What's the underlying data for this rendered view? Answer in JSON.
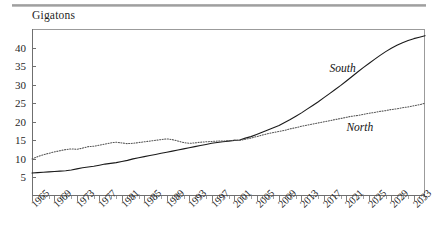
{
  "figure": {
    "top_rule": "horizontal-rule",
    "axis_caption": "Gigatons"
  },
  "chart_data": {
    "type": "line",
    "title": "",
    "subtitle": "",
    "xlabel": "",
    "ylabel": "Gigatons",
    "ylim": [
      0,
      45
    ],
    "xlim": [
      1965,
      2035
    ],
    "grid": false,
    "legend_position": "inline-annotation",
    "y_ticks": [
      5,
      10,
      15,
      20,
      25,
      30,
      35,
      40
    ],
    "x_ticks": [
      1965,
      1969,
      1973,
      1977,
      1981,
      1985,
      1989,
      1993,
      1997,
      2001,
      2005,
      2009,
      2013,
      2017,
      2021,
      2025,
      2029,
      2033
    ],
    "x_minor_tick_interval": 1,
    "x": [
      1965,
      1966,
      1967,
      1968,
      1969,
      1970,
      1971,
      1972,
      1973,
      1974,
      1975,
      1976,
      1977,
      1978,
      1979,
      1980,
      1981,
      1982,
      1983,
      1984,
      1985,
      1986,
      1987,
      1988,
      1989,
      1990,
      1991,
      1992,
      1993,
      1994,
      1995,
      1996,
      1997,
      1998,
      1999,
      2000,
      2001,
      2002,
      2003,
      2004,
      2005,
      2006,
      2007,
      2008,
      2009,
      2010,
      2011,
      2012,
      2013,
      2014,
      2015,
      2016,
      2017,
      2018,
      2019,
      2020,
      2021,
      2022,
      2023,
      2024,
      2025,
      2026,
      2027,
      2028,
      2029,
      2030,
      2031,
      2032,
      2033,
      2034,
      2035
    ],
    "series": [
      {
        "name": "South",
        "style": "solid",
        "color": "#1a1a1a",
        "label_text": "South",
        "values": [
          6.2,
          6.3,
          6.4,
          6.5,
          6.6,
          6.7,
          6.8,
          7.0,
          7.3,
          7.6,
          7.8,
          8.0,
          8.3,
          8.6,
          8.8,
          9.0,
          9.3,
          9.6,
          10.0,
          10.3,
          10.6,
          10.9,
          11.2,
          11.5,
          11.8,
          12.1,
          12.4,
          12.7,
          13.0,
          13.3,
          13.6,
          13.9,
          14.2,
          14.4,
          14.6,
          14.8,
          15.0,
          15.1,
          15.6,
          16.0,
          16.6,
          17.2,
          17.8,
          18.4,
          19.0,
          19.8,
          20.6,
          21.5,
          22.4,
          23.4,
          24.4,
          25.4,
          26.5,
          27.6,
          28.7,
          29.8,
          31.0,
          32.2,
          33.4,
          34.6,
          35.7,
          36.8,
          37.9,
          38.9,
          39.8,
          40.6,
          41.3,
          41.9,
          42.4,
          42.8,
          43.2
        ]
      },
      {
        "name": "North",
        "style": "dotted",
        "color": "#4a4a4a",
        "label_text": "North",
        "values": [
          10.0,
          10.6,
          11.1,
          11.5,
          11.9,
          12.2,
          12.5,
          12.7,
          12.6,
          12.9,
          13.3,
          13.4,
          13.7,
          14.0,
          14.3,
          14.5,
          14.3,
          14.1,
          14.2,
          14.4,
          14.6,
          14.8,
          15.0,
          15.2,
          15.4,
          15.2,
          14.8,
          14.4,
          14.2,
          14.3,
          14.5,
          14.6,
          14.7,
          14.8,
          14.8,
          14.9,
          15.0,
          15.0,
          15.3,
          15.6,
          16.0,
          16.4,
          16.8,
          17.1,
          17.4,
          17.7,
          18.1,
          18.4,
          18.8,
          19.1,
          19.4,
          19.7,
          20.0,
          20.3,
          20.6,
          20.9,
          21.2,
          21.5,
          21.7,
          22.0,
          22.3,
          22.5,
          22.8,
          23.0,
          23.3,
          23.5,
          23.8,
          24.0,
          24.3,
          24.6,
          25.0
        ]
      }
    ],
    "annotations": [
      {
        "text": "South",
        "x": 2018,
        "y": 34.0
      },
      {
        "text": "North",
        "x": 2021,
        "y": 18.0
      }
    ]
  }
}
